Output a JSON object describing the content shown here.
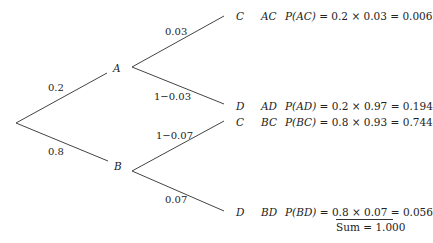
{
  "tree": {
    "root_branches": [
      {
        "label": "0.2",
        "to": "A"
      },
      {
        "label": "0.8",
        "to": "B"
      }
    ],
    "nodes": {
      "A": "A",
      "B": "B"
    },
    "A_branches": [
      {
        "label": "0.03",
        "to": "C"
      },
      {
        "label": "1−0.03",
        "to": "D"
      }
    ],
    "B_branches": [
      {
        "label": "1−0.07",
        "to": "C"
      },
      {
        "label": "0.07",
        "to": "D"
      }
    ],
    "outcomes": [
      {
        "leaf": "C",
        "event": "AC",
        "prob_name": "P(AC)",
        "calc": "= 0.2 × 0.03 = 0.006"
      },
      {
        "leaf": "D",
        "event": "AD",
        "prob_name": "P(AD)",
        "calc": "= 0.2 × 0.97 = 0.194"
      },
      {
        "leaf": "C",
        "event": "BC",
        "prob_name": "P(BC)",
        "calc": "= 0.8 × 0.93 = 0.744"
      },
      {
        "leaf": "D",
        "event": "BD",
        "prob_name": "P(BD)",
        "calc": "= 0.8 × 0.07 = 0.056"
      }
    ],
    "sum": "Sum = 1.000"
  }
}
